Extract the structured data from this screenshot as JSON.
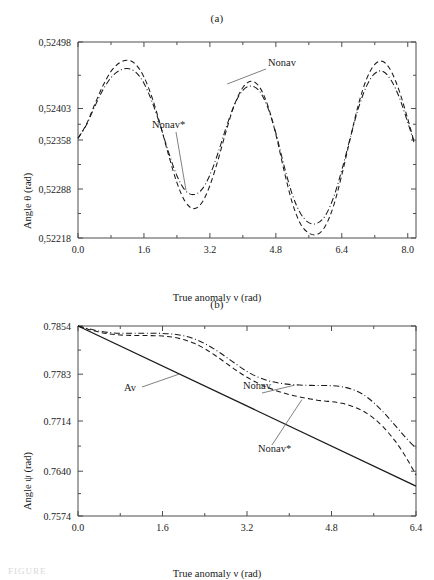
{
  "figure": {
    "caption_fragment": "FIGURE",
    "panels": [
      {
        "id": "a",
        "label": "(a)",
        "ylabel": "Angle θ (rad)",
        "xlabel": "True anomaly  ν (rad)",
        "annotations": [
          {
            "text": "Nonav"
          },
          {
            "text": "Nonav*"
          }
        ]
      },
      {
        "id": "b",
        "label": "(b)",
        "ylabel": "Angle ψ (rad)",
        "xlabel": "True anomaly ν (rad)",
        "annotations": [
          {
            "text": "Av"
          },
          {
            "text": "Nonav"
          },
          {
            "text": "Nonav*"
          }
        ]
      }
    ]
  },
  "chart_data": [
    {
      "type": "line",
      "panel": "a",
      "title": "(a)",
      "xlabel": "True anomaly  ν (rad)",
      "ylabel": "Angle θ (rad)",
      "xlim": [
        0.0,
        8.2
      ],
      "ylim": [
        0.52218,
        0.52498
      ],
      "xticks": [
        0.0,
        1.6,
        3.2,
        4.8,
        6.4,
        8.0
      ],
      "xticklabels": [
        "0.0",
        "1.6",
        "3.2",
        "4.8",
        "6.4",
        "8.0"
      ],
      "yticks": [
        0.52218,
        0.52288,
        0.52358,
        0.52403,
        0.52498
      ],
      "yticklabels": [
        "0,52218",
        "0,52288",
        "0,52358",
        "0,52403",
        "0,52498"
      ],
      "grid": false,
      "legend": "annotated-inline",
      "series": [
        {
          "name": "Nonav",
          "style": "dashed",
          "x": [
            0.0,
            0.2,
            0.4,
            0.6,
            0.8,
            1.0,
            1.2,
            1.4,
            1.6,
            1.8,
            2.0,
            2.2,
            2.4,
            2.6,
            2.8,
            3.0,
            3.2,
            3.4,
            3.6,
            3.8,
            4.0,
            4.2,
            4.4,
            4.6,
            4.8,
            5.0,
            5.2,
            5.4,
            5.6,
            5.8,
            6.0,
            6.2,
            6.4,
            6.6,
            6.8,
            7.0,
            7.2,
            7.4,
            7.6,
            7.8,
            8.0,
            8.15
          ],
          "y": [
            0.523605,
            0.5238,
            0.52408,
            0.52435,
            0.52456,
            0.52468,
            0.52472,
            0.52466,
            0.52448,
            0.52418,
            0.52379,
            0.52336,
            0.52297,
            0.5227,
            0.5226,
            0.52268,
            0.52293,
            0.5233,
            0.52372,
            0.52409,
            0.52433,
            0.52442,
            0.52434,
            0.52408,
            0.52366,
            0.52314,
            0.52268,
            0.52238,
            0.52225,
            0.52223,
            0.52235,
            0.52264,
            0.52308,
            0.52359,
            0.52408,
            0.52445,
            0.52466,
            0.5247,
            0.52456,
            0.52427,
            0.52388,
            0.52356
          ]
        },
        {
          "name": "Nonav*",
          "style": "dash-dot",
          "x": [
            0.0,
            0.2,
            0.4,
            0.6,
            0.8,
            1.0,
            1.2,
            1.4,
            1.6,
            1.8,
            2.0,
            2.2,
            2.4,
            2.6,
            2.8,
            3.0,
            3.2,
            3.4,
            3.6,
            3.8,
            4.0,
            4.2,
            4.4,
            4.6,
            4.8,
            5.0,
            5.2,
            5.4,
            5.6,
            5.8,
            6.0,
            6.2,
            6.4,
            6.6,
            6.8,
            7.0,
            7.2,
            7.4,
            7.6,
            7.8,
            8.0,
            8.15
          ],
          "y": [
            0.523605,
            0.52379,
            0.52405,
            0.52429,
            0.52447,
            0.52457,
            0.5246,
            0.52455,
            0.52439,
            0.52412,
            0.52378,
            0.5234,
            0.52307,
            0.52286,
            0.5228,
            0.52287,
            0.52308,
            0.5234,
            0.52377,
            0.52409,
            0.52429,
            0.52435,
            0.52428,
            0.52405,
            0.52368,
            0.52321,
            0.5228,
            0.52253,
            0.5224,
            0.52239,
            0.5225,
            0.52276,
            0.52315,
            0.5236,
            0.52403,
            0.52435,
            0.52453,
            0.52456,
            0.52443,
            0.52418,
            0.52383,
            0.52355
          ]
        }
      ]
    },
    {
      "type": "line",
      "panel": "b",
      "title": "(b)",
      "xlabel": "True anomaly ν (rad)",
      "ylabel": "Angle ψ (rad)",
      "xlim": [
        0.0,
        6.4
      ],
      "ylim": [
        0.7574,
        0.7854
      ],
      "xticks": [
        0.0,
        1.6,
        3.2,
        4.8,
        6.4
      ],
      "xticklabels": [
        "0.0",
        "1.6",
        "3.2",
        "4.8",
        "6.4"
      ],
      "yticks": [
        0.7574,
        0.764,
        0.7714,
        0.7783,
        0.7854
      ],
      "yticklabels": [
        "0.7574",
        "0.7640",
        "0.7714",
        "0.7783",
        "0.7854"
      ],
      "grid": false,
      "legend": "annotated-inline",
      "series": [
        {
          "name": "Av",
          "style": "solid",
          "x": [
            0.0,
            6.4
          ],
          "y": [
            0.7854,
            0.7618
          ]
        },
        {
          "name": "Nonav",
          "style": "dash-dot",
          "x": [
            0.0,
            0.2,
            0.4,
            0.6,
            0.8,
            1.0,
            1.2,
            1.4,
            1.6,
            1.8,
            2.0,
            2.2,
            2.4,
            2.6,
            2.8,
            3.0,
            3.2,
            3.4,
            3.6,
            3.8,
            4.0,
            4.2,
            4.4,
            4.6,
            4.8,
            5.0,
            5.2,
            5.4,
            5.6,
            5.8,
            6.0,
            6.2,
            6.4
          ],
          "y": [
            0.7854,
            0.785,
            0.78465,
            0.78443,
            0.78434,
            0.78432,
            0.78432,
            0.78432,
            0.7843,
            0.7842,
            0.78395,
            0.7835,
            0.7828,
            0.7819,
            0.78085,
            0.77975,
            0.7787,
            0.7779,
            0.77735,
            0.777,
            0.7768,
            0.7767,
            0.77665,
            0.77662,
            0.7766,
            0.77645,
            0.77605,
            0.7753,
            0.7741,
            0.77255,
            0.7708,
            0.769,
            0.7674
          ]
        },
        {
          "name": "Nonav*",
          "style": "dashed",
          "x": [
            0.0,
            0.2,
            0.4,
            0.6,
            0.8,
            1.0,
            1.2,
            1.4,
            1.6,
            1.8,
            2.0,
            2.2,
            2.4,
            2.6,
            2.8,
            3.0,
            3.2,
            3.4,
            3.6,
            3.8,
            4.0,
            4.2,
            4.4,
            4.6,
            4.8,
            5.0,
            5.2,
            5.4,
            5.6,
            5.8,
            6.0,
            6.2,
            6.4
          ],
          "y": [
            0.7854,
            0.7849,
            0.7845,
            0.78422,
            0.78408,
            0.78402,
            0.784,
            0.78398,
            0.78392,
            0.78375,
            0.7834,
            0.78285,
            0.78205,
            0.78105,
            0.77995,
            0.77885,
            0.77785,
            0.777,
            0.7763,
            0.77575,
            0.7753,
            0.77495,
            0.77465,
            0.7744,
            0.77425,
            0.774,
            0.77355,
            0.77285,
            0.7718,
            0.77035,
            0.7685,
            0.7662,
            0.76345
          ]
        }
      ]
    }
  ]
}
